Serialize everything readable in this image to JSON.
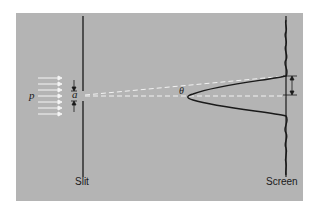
{
  "figure": {
    "labels": {
      "slit": "Slit",
      "screen": "Screen",
      "momentum": "p",
      "slit_width": "a",
      "angle": "θ"
    },
    "elements": [
      "incident plane wave arrows (momentum p)",
      "slit barrier with opening of width a",
      "dashed lines from slit to screen: central axis and first minimum at angle θ",
      "diffraction intensity pattern on screen (central maximum with side lobes)",
      "double-headed arrow on screen marking first-minimum distance"
    ],
    "colors": {
      "background": "#b4b4b4",
      "lines": "#1a1a1a",
      "dashed": "#f2f2f2",
      "arrows": "#f5f5f5"
    }
  }
}
